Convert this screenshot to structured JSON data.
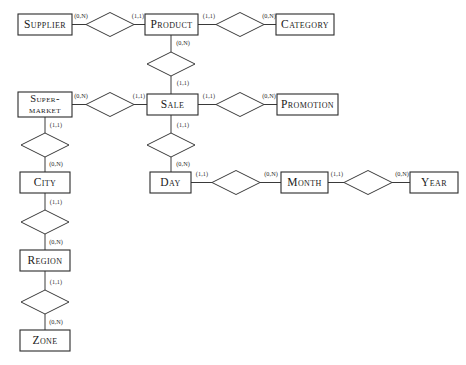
{
  "diagram": {
    "type": "er-diagram",
    "background_color": "#ffffff",
    "line_color": "#3a3a3a",
    "box_stroke_color": "#2b2b2b",
    "text_color": "#1a1a1a"
  },
  "entities": [
    {
      "id": "supplier",
      "label": "Supplier",
      "x": 18,
      "y": 14,
      "w": 54,
      "h": 21,
      "lines": [
        "Supplier"
      ]
    },
    {
      "id": "product",
      "label": "Product",
      "x": 145,
      "y": 14,
      "w": 53,
      "h": 21,
      "lines": [
        "Product"
      ]
    },
    {
      "id": "category",
      "label": "Category",
      "x": 276,
      "y": 14,
      "w": 58,
      "h": 21,
      "lines": [
        "Category"
      ]
    },
    {
      "id": "supermarket",
      "label": "Supermarket",
      "x": 18,
      "y": 92,
      "w": 54,
      "h": 25,
      "lines": [
        "Super-",
        "market"
      ]
    },
    {
      "id": "sale",
      "label": "Sale",
      "x": 147,
      "y": 94,
      "w": 51,
      "h": 21,
      "lines": [
        "Sale"
      ]
    },
    {
      "id": "promotion",
      "label": "Promotion",
      "x": 277,
      "y": 94,
      "w": 61,
      "h": 21,
      "lines": [
        "Promotion"
      ]
    },
    {
      "id": "city",
      "label": "City",
      "x": 20,
      "y": 172,
      "w": 50,
      "h": 21,
      "lines": [
        "City"
      ]
    },
    {
      "id": "day",
      "label": "Day",
      "x": 150,
      "y": 172,
      "w": 41,
      "h": 21,
      "lines": [
        "Day"
      ]
    },
    {
      "id": "month",
      "label": "Month",
      "x": 281,
      "y": 172,
      "w": 47,
      "h": 21,
      "lines": [
        "Month"
      ]
    },
    {
      "id": "year",
      "label": "Year",
      "x": 410,
      "y": 172,
      "w": 48,
      "h": 21,
      "lines": [
        "Year"
      ]
    },
    {
      "id": "region",
      "label": "Region",
      "x": 20,
      "y": 250,
      "w": 50,
      "h": 21,
      "lines": [
        "Region"
      ]
    },
    {
      "id": "zone",
      "label": "Zone",
      "x": 20,
      "y": 330,
      "w": 50,
      "h": 21,
      "lines": [
        "Zone"
      ]
    }
  ],
  "relationships": [
    {
      "id": "supplier-product",
      "cx": 110,
      "cy": 24.5,
      "rx": 24,
      "ry": 12
    },
    {
      "id": "product-category",
      "cx": 240,
      "cy": 24.5,
      "rx": 24,
      "ry": 12
    },
    {
      "id": "product-sale",
      "cx": 171,
      "cy": 64,
      "rx": 24,
      "ry": 12
    },
    {
      "id": "supermarket-sale",
      "cx": 110,
      "cy": 104.5,
      "rx": 24,
      "ry": 12
    },
    {
      "id": "sale-promotion",
      "cx": 240,
      "cy": 104.5,
      "rx": 24,
      "ry": 12
    },
    {
      "id": "supermarket-city",
      "cx": 45,
      "cy": 145,
      "rx": 24,
      "ry": 12
    },
    {
      "id": "sale-day",
      "cx": 171,
      "cy": 145,
      "rx": 24,
      "ry": 12
    },
    {
      "id": "day-month",
      "cx": 236,
      "cy": 182.5,
      "rx": 24,
      "ry": 12
    },
    {
      "id": "month-year",
      "cx": 368,
      "cy": 182.5,
      "rx": 24,
      "ry": 12
    },
    {
      "id": "city-region",
      "cx": 45,
      "cy": 222,
      "rx": 24,
      "ry": 12
    },
    {
      "id": "region-zone",
      "cx": 45,
      "cy": 302,
      "rx": 24,
      "ry": 12
    }
  ],
  "connectors": [
    {
      "id": "c-supplier-rel",
      "x1": 72,
      "y1": 24.5,
      "x2": 86,
      "y2": 24.5
    },
    {
      "id": "c-rel-product",
      "x1": 134,
      "y1": 24.5,
      "x2": 145,
      "y2": 24.5
    },
    {
      "id": "c-product-rel2",
      "x1": 198,
      "y1": 24.5,
      "x2": 216,
      "y2": 24.5
    },
    {
      "id": "c-rel2-category",
      "x1": 264,
      "y1": 24.5,
      "x2": 276,
      "y2": 24.5
    },
    {
      "id": "c-product-reldown",
      "x1": 171,
      "y1": 35,
      "x2": 171,
      "y2": 52
    },
    {
      "id": "c-reldown-sale",
      "x1": 171,
      "y1": 76,
      "x2": 171,
      "y2": 94
    },
    {
      "id": "c-supermkt-rel",
      "x1": 72,
      "y1": 104.5,
      "x2": 86,
      "y2": 104.5
    },
    {
      "id": "c-rel-sale",
      "x1": 134,
      "y1": 104.5,
      "x2": 147,
      "y2": 104.5
    },
    {
      "id": "c-sale-relpromo",
      "x1": 198,
      "y1": 104.5,
      "x2": 216,
      "y2": 104.5
    },
    {
      "id": "c-relpromo-promo",
      "x1": 264,
      "y1": 104.5,
      "x2": 277,
      "y2": 104.5
    },
    {
      "id": "c-supermkt-down",
      "x1": 45,
      "y1": 117,
      "x2": 45,
      "y2": 133
    },
    {
      "id": "c-relcity-city",
      "x1": 45,
      "y1": 157,
      "x2": 45,
      "y2": 172
    },
    {
      "id": "c-sale-down",
      "x1": 171,
      "y1": 115,
      "x2": 171,
      "y2": 133
    },
    {
      "id": "c-relday-day",
      "x1": 171,
      "y1": 157,
      "x2": 171,
      "y2": 172
    },
    {
      "id": "c-day-relmonth",
      "x1": 191,
      "y1": 182.5,
      "x2": 212,
      "y2": 182.5
    },
    {
      "id": "c-relmonth-month",
      "x1": 260,
      "y1": 182.5,
      "x2": 281,
      "y2": 182.5
    },
    {
      "id": "c-month-relyear",
      "x1": 328,
      "y1": 182.5,
      "x2": 344,
      "y2": 182.5
    },
    {
      "id": "c-relyear-year",
      "x1": 392,
      "y1": 182.5,
      "x2": 410,
      "y2": 182.5
    },
    {
      "id": "c-city-down",
      "x1": 45,
      "y1": 193,
      "x2": 45,
      "y2": 210
    },
    {
      "id": "c-relregion-reg",
      "x1": 45,
      "y1": 234,
      "x2": 45,
      "y2": 250
    },
    {
      "id": "c-region-down",
      "x1": 45,
      "y1": 271,
      "x2": 45,
      "y2": 290
    },
    {
      "id": "c-relzone-zone",
      "x1": 45,
      "y1": 314,
      "x2": 45,
      "y2": 330
    }
  ],
  "cardinalities": [
    {
      "id": "card-supplier",
      "text": "(0,N)",
      "x": 81,
      "y": 17
    },
    {
      "id": "card-product-left",
      "text": "(1,1)",
      "x": 138,
      "y": 17
    },
    {
      "id": "card-product-right",
      "text": "(1,1)",
      "x": 209,
      "y": 17
    },
    {
      "id": "card-category",
      "text": "(0,N)",
      "x": 269,
      "y": 17
    },
    {
      "id": "card-product-down",
      "text": "(0,N)",
      "x": 183,
      "y": 44
    },
    {
      "id": "card-sale-up",
      "text": "(1,1)",
      "x": 183,
      "y": 84
    },
    {
      "id": "card-supermarket",
      "text": "(0,N)",
      "x": 81,
      "y": 97
    },
    {
      "id": "card-sale-left",
      "text": "(1,1)",
      "x": 139,
      "y": 97
    },
    {
      "id": "card-sale-right",
      "text": "(1,1)",
      "x": 209,
      "y": 97
    },
    {
      "id": "card-promotion",
      "text": "(0,N)",
      "x": 269,
      "y": 97
    },
    {
      "id": "card-supermkt-down",
      "text": "(1,1)",
      "x": 56,
      "y": 126
    },
    {
      "id": "card-city-up",
      "text": "(0,N)",
      "x": 56,
      "y": 165
    },
    {
      "id": "card-sale-down",
      "text": "(1,1)",
      "x": 183,
      "y": 126
    },
    {
      "id": "card-day-up",
      "text": "(0,N)",
      "x": 183,
      "y": 165
    },
    {
      "id": "card-day-right",
      "text": "(1,1)",
      "x": 202,
      "y": 175
    },
    {
      "id": "card-month-left",
      "text": "(0,N)",
      "x": 271,
      "y": 175
    },
    {
      "id": "card-month-right",
      "text": "(1,1)",
      "x": 337,
      "y": 175
    },
    {
      "id": "card-year",
      "text": "(0,N)",
      "x": 402,
      "y": 175
    },
    {
      "id": "card-city-down",
      "text": "(1,1)",
      "x": 56,
      "y": 203
    },
    {
      "id": "card-region-up",
      "text": "(0,N)",
      "x": 56,
      "y": 243
    },
    {
      "id": "card-region-down",
      "text": "(1,1)",
      "x": 56,
      "y": 283
    },
    {
      "id": "card-zone-up",
      "text": "(0,N)",
      "x": 56,
      "y": 323
    }
  ]
}
